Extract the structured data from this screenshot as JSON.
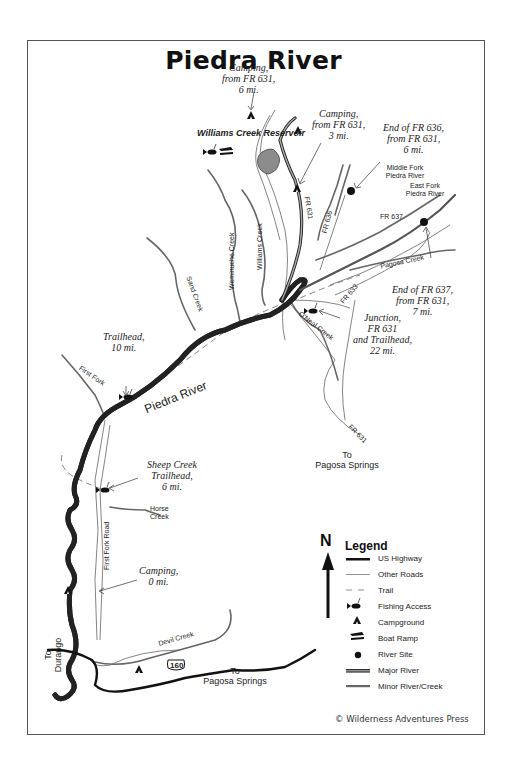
{
  "map": {
    "title": "Piedra River",
    "copyright": "© Wilderness Adventures Press"
  },
  "places": {
    "reservoir": "Williams Creek Reservoir",
    "piedra_river": "Piedra River",
    "middle_fork": "Middle Fork Piedra River",
    "east_fork": "East Fork Piedra River",
    "to_pagosa_1_to": "To",
    "to_pagosa_1": "Pagosa Springs",
    "to_pagosa_2_to": "To",
    "to_pagosa_2": "Pagosa Springs",
    "to_durango_to": "To",
    "to_durango": "Durango",
    "highway_shield": "160"
  },
  "creeks": {
    "weminuche": "Weminuche Creek",
    "williams": "Williams Creek",
    "sand": "Sand Creek",
    "first_fork": "First Fork",
    "oneal": "O'Neal Creek",
    "pagosa": "Pagosa Creek",
    "horse": "Horse",
    "horse2": "Creek",
    "devil": "Devil Creek"
  },
  "roads": {
    "fr631_north": "FR 631",
    "fr636": "FR 636",
    "fr637": "FR 637",
    "fr633": "FR 633",
    "fr631_south": "FR 631",
    "first_fork_road": "First Fork Road"
  },
  "annotations": {
    "camping_6mi": [
      "Camping,",
      "from FR 631,",
      "6 mi."
    ],
    "camping_3mi": [
      "Camping,",
      "from FR 631,",
      "3 mi."
    ],
    "end_fr636": [
      "End of FR 636,",
      "from FR 631,",
      "6 mi."
    ],
    "end_fr637": [
      "End of FR 637,",
      "from FR 631,",
      "7 mi."
    ],
    "junction": [
      "Junction,",
      "FR 631",
      "and Trailhead,",
      "22 mi."
    ],
    "trailhead_10": [
      "Trailhead,",
      "10 mi."
    ],
    "sheep_creek": [
      "Sheep Creek",
      "Trailhead,",
      "6 mi."
    ],
    "camping_0": [
      "Camping,",
      "0 mi."
    ]
  },
  "legend": {
    "north": "N",
    "title": "Legend",
    "items": [
      {
        "label": "US Highway",
        "symbol": "us-highway-line"
      },
      {
        "label": "Other Roads",
        "symbol": "other-roads-line"
      },
      {
        "label": "Trail",
        "symbol": "trail-dashed-line"
      },
      {
        "label": "Fishing Access",
        "symbol": "fish-icon"
      },
      {
        "label": "Campground",
        "symbol": "tent-icon"
      },
      {
        "label": "Boat Ramp",
        "symbol": "boat-ramp-icon"
      },
      {
        "label": "River Site",
        "symbol": "dot-icon"
      },
      {
        "label": "Major River",
        "symbol": "major-river-line"
      },
      {
        "label": "Minor River/Creek",
        "symbol": "minor-river-line"
      }
    ]
  },
  "colors": {
    "river_fill": "#8a8a8a",
    "road": "#6e6e6e",
    "highway": "#111111",
    "reservoir": "#8c8c8c"
  }
}
